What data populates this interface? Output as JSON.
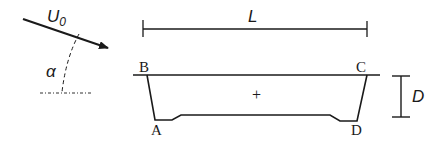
{
  "diagram": {
    "flow": {
      "velocity_label": "U",
      "velocity_subscript": "0",
      "angle_label": "α"
    },
    "dimensions": {
      "length_label": "L",
      "depth_label": "D"
    },
    "section": {
      "corner_labels": {
        "top_left": "B",
        "top_right": "C",
        "bottom_left": "A",
        "bottom_right": "D"
      },
      "center_marker": "+"
    },
    "colors": {
      "ink": "#1a1a1a",
      "background": "#ffffff"
    }
  }
}
